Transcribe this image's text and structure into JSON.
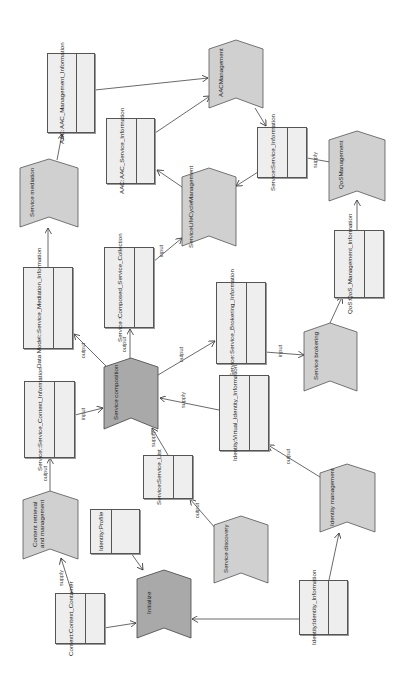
{
  "diagram": {
    "orientation": "rotated-90-ccw",
    "colors": {
      "process_fill_light": "#d0d0d0",
      "process_fill_dark": "#a9a9a9",
      "object_fill": "#eeeeee",
      "stroke": "#555555"
    },
    "processes": [
      {
        "id": "aac_management",
        "label": "AACManagement"
      },
      {
        "id": "service_mediation",
        "label": "Service mediation"
      },
      {
        "id": "service_lifecycle_management",
        "label": "ServiceLifeCycleManagement"
      },
      {
        "id": "qos_management",
        "label": "QoSManagement"
      },
      {
        "id": "service_composition",
        "label": "Service composition"
      },
      {
        "id": "service_brokering",
        "label": "Service brokering"
      },
      {
        "id": "content_retrieval",
        "label": "Content retrieval and management"
      },
      {
        "id": "service_discovery",
        "label": "Service discovery"
      },
      {
        "id": "identity_management",
        "label": "Identity management"
      },
      {
        "id": "initialize",
        "label": "Initialize"
      }
    ],
    "objects": [
      {
        "id": "aac_mgmt_info",
        "line1": "AAC:",
        "line2": "AAC_Management_Information"
      },
      {
        "id": "aac_service_info",
        "line1": "AAC:",
        "line2": "AAC_Service_Information"
      },
      {
        "id": "service_info",
        "line1": "Service:",
        "line2": "Service_Information"
      },
      {
        "id": "data_model",
        "line1": "Data Model::",
        "line2": "Service_Mediation_Information"
      },
      {
        "id": "composed_collection",
        "line1": "Service :",
        "line2": "Composed_Service_Collection"
      },
      {
        "id": "brokering_info",
        "line1": "Service:",
        "line2": "Service_Brokering_Information"
      },
      {
        "id": "qos_info",
        "line1": "QoS:",
        "line2": "QoS_Management_Information"
      },
      {
        "id": "context_info",
        "line1": "Service::",
        "line2": "Service_Context_Information"
      },
      {
        "id": "virtual_identity",
        "line1": "Identity:",
        "line2": "Virtual_Identity_Information"
      },
      {
        "id": "service_list",
        "line1": "Service:",
        "line2": "Service_List"
      },
      {
        "id": "identity_profile",
        "line1": "Identity:Profile",
        "line2": ""
      },
      {
        "id": "context_container",
        "line1": "Context:",
        "line2": "Context_Container"
      },
      {
        "id": "identity_info",
        "line1": "Identity:",
        "line2": "Identity_Information"
      }
    ],
    "edge_labels": {
      "input": "input",
      "output": "output",
      "supply": "supply"
    }
  }
}
